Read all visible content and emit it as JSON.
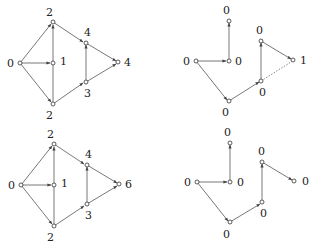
{
  "diagram": {
    "graphs": [
      {
        "id": "top-left",
        "nodes": [
          {
            "id": "s",
            "label": "0"
          },
          {
            "id": "a",
            "label": "2"
          },
          {
            "id": "m",
            "label": "1"
          },
          {
            "id": "b",
            "label": "2"
          },
          {
            "id": "c",
            "label": "4"
          },
          {
            "id": "d",
            "label": "3"
          },
          {
            "id": "t",
            "label": "4"
          }
        ]
      },
      {
        "id": "top-right",
        "nodes": [
          {
            "id": "s",
            "label": "0"
          },
          {
            "id": "a",
            "label": "0"
          },
          {
            "id": "m",
            "label": "0"
          },
          {
            "id": "b",
            "label": "0"
          },
          {
            "id": "c",
            "label": "0"
          },
          {
            "id": "d",
            "label": "0"
          },
          {
            "id": "t",
            "label": "1"
          }
        ]
      },
      {
        "id": "bottom-left",
        "nodes": [
          {
            "id": "s",
            "label": "0"
          },
          {
            "id": "a",
            "label": "2"
          },
          {
            "id": "m",
            "label": "1"
          },
          {
            "id": "b",
            "label": "2"
          },
          {
            "id": "c",
            "label": "4"
          },
          {
            "id": "d",
            "label": "3"
          },
          {
            "id": "t",
            "label": "6"
          }
        ]
      },
      {
        "id": "bottom-right",
        "nodes": [
          {
            "id": "s",
            "label": "0"
          },
          {
            "id": "a",
            "label": "0"
          },
          {
            "id": "m",
            "label": "0"
          },
          {
            "id": "b",
            "label": "0"
          },
          {
            "id": "c",
            "label": "0"
          },
          {
            "id": "d",
            "label": "0"
          },
          {
            "id": "t",
            "label": "0"
          }
        ]
      }
    ]
  }
}
